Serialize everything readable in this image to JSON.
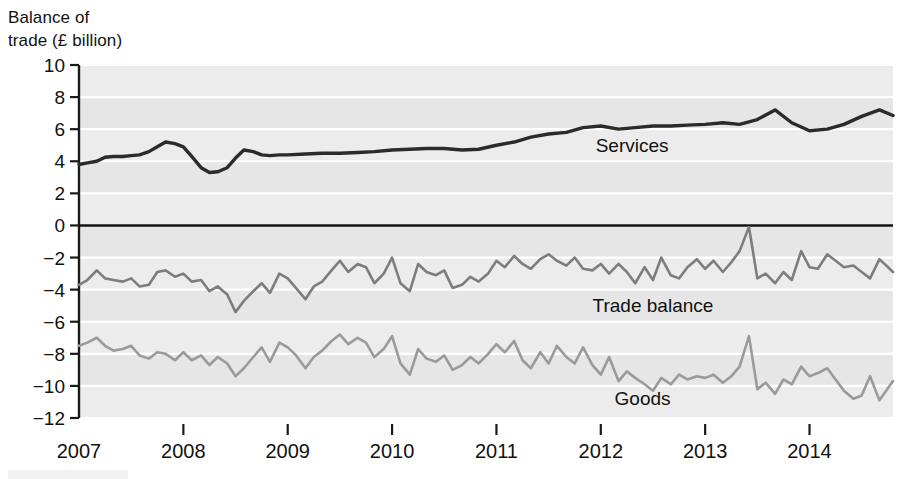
{
  "axis_title": "Balance of\ntrade (£ billion)",
  "axis": {
    "ylabel_line1": "Balance of",
    "ylabel_line2": "trade (£ billion)",
    "y_ticks": [
      "10",
      "8",
      "6",
      "4",
      "2",
      "0",
      "−2",
      "−4",
      "−6",
      "−8",
      "−10",
      "−12"
    ],
    "x_ticks": [
      "2007",
      "2008",
      "2009",
      "2010",
      "2011",
      "2012",
      "2013",
      "2014"
    ]
  },
  "labels": {
    "services": "Services",
    "trade_balance": "Trade balance",
    "goods": "Goods"
  },
  "colors": {
    "services": "#2b2b2b",
    "trade_balance": "#7d7d7d",
    "goods": "#9a9a9a",
    "zero_line": "#111111",
    "band": "#ebebeb",
    "gridline": "#ffffff"
  },
  "chart_data": {
    "type": "line",
    "title": "Balance of trade (£ billion)",
    "xlabel": "",
    "ylabel": "Balance of trade (£ billion)",
    "xlim": [
      2007.0,
      2014.8
    ],
    "ylim": [
      -12,
      10
    ],
    "y_ticks": [
      10,
      8,
      6,
      4,
      2,
      0,
      -2,
      -4,
      -6,
      -8,
      -10,
      -12
    ],
    "x_ticks": [
      2007,
      2008,
      2009,
      2010,
      2011,
      2012,
      2013,
      2014
    ],
    "grid": "horizontal",
    "legend": "inline-annotations",
    "annotations": [
      {
        "text": "Services",
        "x": 2012.3,
        "y": 4.6
      },
      {
        "text": "Trade balance",
        "x": 2012.5,
        "y": -5.4
      },
      {
        "text": "Goods",
        "x": 2012.4,
        "y": -11.2
      }
    ],
    "series": [
      {
        "name": "Services",
        "color": "#2b2b2b",
        "frequency": "quarterly",
        "x": [
          2007.0,
          2007.08,
          2007.17,
          2007.25,
          2007.33,
          2007.42,
          2007.5,
          2007.58,
          2007.67,
          2007.75,
          2007.83,
          2007.92,
          2008.0,
          2008.08,
          2008.17,
          2008.25,
          2008.33,
          2008.42,
          2008.5,
          2008.58,
          2008.67,
          2008.75,
          2008.83,
          2008.92,
          2009.0,
          2009.17,
          2009.33,
          2009.5,
          2009.67,
          2009.83,
          2010.0,
          2010.17,
          2010.33,
          2010.5,
          2010.67,
          2010.83,
          2011.0,
          2011.17,
          2011.33,
          2011.5,
          2011.67,
          2011.83,
          2012.0,
          2012.17,
          2012.33,
          2012.5,
          2012.67,
          2012.83,
          2013.0,
          2013.17,
          2013.33,
          2013.5,
          2013.67,
          2013.83,
          2014.0,
          2014.17,
          2014.33,
          2014.5,
          2014.67,
          2014.8
        ],
        "y": [
          3.8,
          3.9,
          4.0,
          4.25,
          4.3,
          4.3,
          4.35,
          4.4,
          4.6,
          4.9,
          5.2,
          5.1,
          4.9,
          4.3,
          3.6,
          3.3,
          3.35,
          3.6,
          4.2,
          4.7,
          4.6,
          4.4,
          4.35,
          4.4,
          4.4,
          4.45,
          4.5,
          4.5,
          4.55,
          4.6,
          4.7,
          4.75,
          4.8,
          4.8,
          4.7,
          4.75,
          5.0,
          5.2,
          5.5,
          5.7,
          5.8,
          6.1,
          6.2,
          6.0,
          6.1,
          6.2,
          6.2,
          6.25,
          6.3,
          6.4,
          6.3,
          6.6,
          7.2,
          6.4,
          5.9,
          6.0,
          6.3,
          6.8,
          7.2,
          6.85
        ],
        "note": "Services balance rises from ~£4bn in 2007 to ~£7bn by 2014"
      },
      {
        "name": "Trade balance",
        "color": "#7d7d7d",
        "frequency": "monthly",
        "x": [
          2007.0,
          2007.08,
          2007.17,
          2007.25,
          2007.33,
          2007.42,
          2007.5,
          2007.58,
          2007.67,
          2007.75,
          2007.83,
          2007.92,
          2008.0,
          2008.08,
          2008.17,
          2008.25,
          2008.33,
          2008.42,
          2008.5,
          2008.58,
          2008.67,
          2008.75,
          2008.83,
          2008.92,
          2009.0,
          2009.08,
          2009.17,
          2009.25,
          2009.33,
          2009.42,
          2009.5,
          2009.58,
          2009.67,
          2009.75,
          2009.83,
          2009.92,
          2010.0,
          2010.08,
          2010.17,
          2010.25,
          2010.33,
          2010.42,
          2010.5,
          2010.58,
          2010.67,
          2010.75,
          2010.83,
          2010.92,
          2011.0,
          2011.08,
          2011.17,
          2011.25,
          2011.33,
          2011.42,
          2011.5,
          2011.58,
          2011.67,
          2011.75,
          2011.83,
          2011.92,
          2012.0,
          2012.08,
          2012.17,
          2012.25,
          2012.33,
          2012.42,
          2012.5,
          2012.58,
          2012.67,
          2012.75,
          2012.83,
          2012.92,
          2013.0,
          2013.08,
          2013.17,
          2013.25,
          2013.33,
          2013.42,
          2013.5,
          2013.58,
          2013.67,
          2013.75,
          2013.83,
          2013.92,
          2014.0,
          2014.08,
          2014.17,
          2014.25,
          2014.33,
          2014.42,
          2014.5,
          2014.58,
          2014.67,
          2014.8
        ],
        "y": [
          -3.7,
          -3.4,
          -2.8,
          -3.3,
          -3.4,
          -3.5,
          -3.3,
          -3.8,
          -3.7,
          -2.9,
          -2.8,
          -3.2,
          -3.0,
          -3.5,
          -3.4,
          -4.1,
          -3.8,
          -4.3,
          -5.4,
          -4.7,
          -4.1,
          -3.6,
          -4.2,
          -3.0,
          -3.3,
          -3.9,
          -4.6,
          -3.8,
          -3.5,
          -2.8,
          -2.2,
          -2.9,
          -2.4,
          -2.6,
          -3.6,
          -3.0,
          -2.0,
          -3.6,
          -4.1,
          -2.4,
          -2.9,
          -3.1,
          -2.8,
          -3.9,
          -3.7,
          -3.2,
          -3.5,
          -3.0,
          -2.2,
          -2.6,
          -1.9,
          -2.4,
          -2.7,
          -2.1,
          -1.8,
          -2.2,
          -2.5,
          -2.0,
          -2.7,
          -2.8,
          -2.4,
          -3.0,
          -2.4,
          -2.9,
          -3.6,
          -2.6,
          -3.4,
          -2.0,
          -3.1,
          -3.3,
          -2.6,
          -2.1,
          -2.7,
          -2.2,
          -2.9,
          -2.3,
          -1.6,
          -0.1,
          -3.3,
          -3.0,
          -3.6,
          -2.9,
          -3.4,
          -1.6,
          -2.6,
          -2.7,
          -1.8,
          -2.2,
          -2.6,
          -2.5,
          -2.9,
          -3.3,
          -2.1,
          -2.9
        ],
        "note": "Total trade balance, monthly, mostly between -2 and -5; spike to ~0 in mid-2013"
      },
      {
        "name": "Goods",
        "color": "#9a9a9a",
        "frequency": "monthly",
        "x": [
          2007.0,
          2007.08,
          2007.17,
          2007.25,
          2007.33,
          2007.42,
          2007.5,
          2007.58,
          2007.67,
          2007.75,
          2007.83,
          2007.92,
          2008.0,
          2008.08,
          2008.17,
          2008.25,
          2008.33,
          2008.42,
          2008.5,
          2008.58,
          2008.67,
          2008.75,
          2008.83,
          2008.92,
          2009.0,
          2009.08,
          2009.17,
          2009.25,
          2009.33,
          2009.42,
          2009.5,
          2009.58,
          2009.67,
          2009.75,
          2009.83,
          2009.92,
          2010.0,
          2010.08,
          2010.17,
          2010.25,
          2010.33,
          2010.42,
          2010.5,
          2010.58,
          2010.67,
          2010.75,
          2010.83,
          2010.92,
          2011.0,
          2011.08,
          2011.17,
          2011.25,
          2011.33,
          2011.42,
          2011.5,
          2011.58,
          2011.67,
          2011.75,
          2011.83,
          2011.92,
          2012.0,
          2012.08,
          2012.17,
          2012.25,
          2012.33,
          2012.42,
          2012.5,
          2012.58,
          2012.67,
          2012.75,
          2012.83,
          2012.92,
          2013.0,
          2013.08,
          2013.17,
          2013.25,
          2013.33,
          2013.42,
          2013.5,
          2013.58,
          2013.67,
          2013.75,
          2013.83,
          2013.92,
          2014.0,
          2014.08,
          2014.17,
          2014.25,
          2014.33,
          2014.42,
          2014.5,
          2014.58,
          2014.67,
          2014.8
        ],
        "y": [
          -7.5,
          -7.3,
          -7.0,
          -7.5,
          -7.8,
          -7.7,
          -7.5,
          -8.1,
          -8.3,
          -7.9,
          -8.0,
          -8.4,
          -7.9,
          -8.4,
          -8.1,
          -8.7,
          -8.2,
          -8.6,
          -9.4,
          -8.9,
          -8.2,
          -7.6,
          -8.5,
          -7.3,
          -7.6,
          -8.1,
          -8.9,
          -8.2,
          -7.8,
          -7.2,
          -6.8,
          -7.4,
          -7.0,
          -7.3,
          -8.2,
          -7.7,
          -6.9,
          -8.6,
          -9.3,
          -7.7,
          -8.3,
          -8.5,
          -8.1,
          -9.0,
          -8.7,
          -8.2,
          -8.6,
          -8.0,
          -7.4,
          -7.9,
          -7.2,
          -8.4,
          -8.9,
          -7.9,
          -8.6,
          -7.5,
          -8.2,
          -8.6,
          -7.6,
          -8.7,
          -9.3,
          -8.2,
          -9.7,
          -9.1,
          -9.5,
          -9.9,
          -10.3,
          -9.5,
          -9.9,
          -9.3,
          -9.6,
          -9.4,
          -9.5,
          -9.3,
          -9.8,
          -9.4,
          -8.8,
          -6.9,
          -10.2,
          -9.8,
          -10.5,
          -9.6,
          -9.9,
          -8.8,
          -9.4,
          -9.2,
          -8.9,
          -9.6,
          -10.3,
          -10.8,
          -10.6,
          -9.4,
          -10.9,
          -9.7
        ],
        "note": "Goods deficit widening from about -7.5bn in 2007 to around -10bn by 2014"
      }
    ]
  }
}
